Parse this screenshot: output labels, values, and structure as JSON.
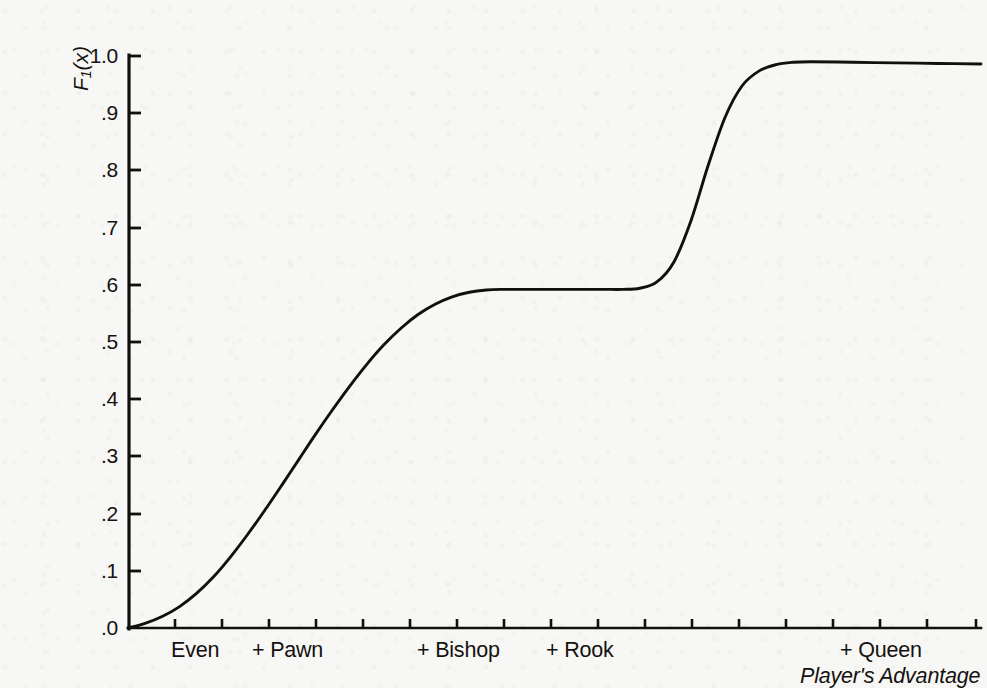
{
  "chart_data": {
    "type": "line",
    "title": "",
    "xlabel": "Player's Advantage",
    "ylabel": "F1(x)",
    "ylabel_base": "F",
    "ylabel_sub": "1",
    "ylabel_arg": "(x)",
    "ylim": [
      0.0,
      1.0
    ],
    "grid": false,
    "legend": null,
    "y_ticks": [
      {
        "value": 1.0,
        "label": "1.0"
      },
      {
        "value": 0.9,
        "label": ".9"
      },
      {
        "value": 0.8,
        "label": ".8"
      },
      {
        "value": 0.7,
        "label": ".7"
      },
      {
        "value": 0.6,
        "label": ".6"
      },
      {
        "value": 0.5,
        "label": ".5"
      },
      {
        "value": 0.4,
        "label": ".4"
      },
      {
        "value": 0.3,
        "label": ".3"
      },
      {
        "value": 0.2,
        "label": ".2"
      },
      {
        "value": 0.1,
        "label": ".1"
      },
      {
        "value": 0.0,
        "label": ".0"
      }
    ],
    "x_tick_count": 18,
    "x_categories": [
      "Even",
      "+ Pawn",
      "+ Bishop",
      "+ Rook",
      "+ Queen"
    ],
    "x_tick_labels": [
      {
        "label": "Even",
        "x_index": 1
      },
      {
        "label": "+ Pawn",
        "x_index": 2.6
      },
      {
        "label": "+ Bishop",
        "x_index": 7.4
      },
      {
        "label": "+ Rook",
        "x_index": 10.2
      },
      {
        "label": "+ Queen",
        "x_index": 16.0
      }
    ],
    "series": [
      {
        "name": "F1(x)",
        "description": "Double sigmoid: rises from 0 to plateau ~0.59, holds, then rises to ~0.99",
        "x": [
          0.0,
          0.02,
          0.04,
          0.06,
          0.08,
          0.1,
          0.12,
          0.14,
          0.16,
          0.18,
          0.2,
          0.22,
          0.24,
          0.26,
          0.28,
          0.3,
          0.32,
          0.34,
          0.36,
          0.38,
          0.4,
          0.42,
          0.44,
          0.46,
          0.48,
          0.5,
          0.52,
          0.54,
          0.56,
          0.58,
          0.6,
          0.62,
          0.64,
          0.66,
          0.68,
          0.7,
          0.72,
          0.74,
          0.76,
          0.78,
          0.8,
          0.85,
          0.9,
          0.95,
          1.0
        ],
        "y": [
          0.0,
          0.008,
          0.02,
          0.037,
          0.06,
          0.089,
          0.124,
          0.163,
          0.205,
          0.249,
          0.294,
          0.339,
          0.382,
          0.423,
          0.461,
          0.495,
          0.524,
          0.548,
          0.566,
          0.579,
          0.587,
          0.591,
          0.592,
          0.592,
          0.592,
          0.592,
          0.592,
          0.592,
          0.592,
          0.592,
          0.594,
          0.605,
          0.64,
          0.712,
          0.808,
          0.893,
          0.948,
          0.974,
          0.985,
          0.989,
          0.99,
          0.989,
          0.988,
          0.987,
          0.986
        ]
      }
    ]
  },
  "axes_geometry": {
    "plot_left_px": 88,
    "plot_right_px": 941,
    "plot_top_px": 40,
    "plot_bottom_px": 612
  },
  "colors": {
    "line": "#12100e",
    "axis": "#12100e",
    "text": "#15110f",
    "background": "#f7f7f5"
  }
}
